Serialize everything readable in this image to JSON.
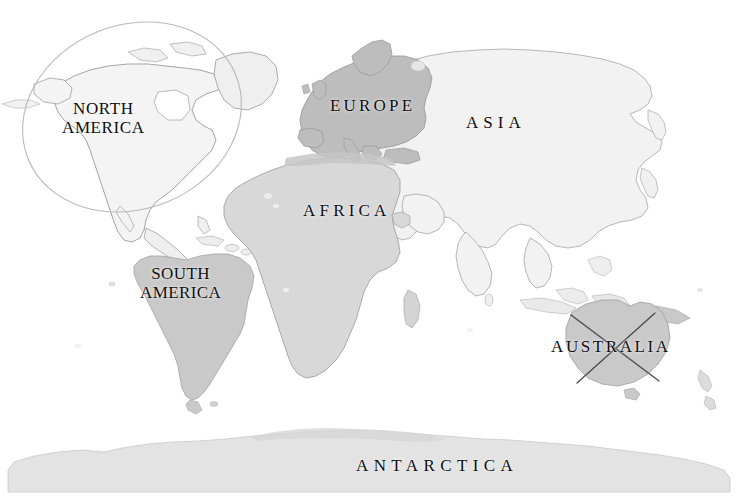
{
  "map": {
    "title": "World Map",
    "projection": "equirectangular",
    "background_color": "#ffffff",
    "width": 737,
    "height": 501,
    "labels": {
      "north_america": "NORTH\nAMERICA",
      "north_america_line1": "NORTH",
      "north_america_line2": "AMERICA",
      "south_america_line1": "SOUTH",
      "south_america_line2": "AMERICA",
      "europe": "EUROPE",
      "africa": "AFRICA",
      "asia": "ASIA",
      "australia": "AUSTRALIA",
      "antarctica": "ANTARCTICA"
    },
    "continents": [
      {
        "name": "north-america",
        "label": "NORTH AMERICA",
        "fill": "#f4f4f4",
        "stroke": "#9a9a9a"
      },
      {
        "name": "south-america",
        "label": "SOUTH AMERICA",
        "fill": "#c9c9c9",
        "stroke": "#a8a8a8"
      },
      {
        "name": "europe",
        "label": "EUROPE",
        "fill": "#bdbdbd",
        "stroke": "#9a9a9a"
      },
      {
        "name": "africa",
        "label": "AFRICA",
        "fill": "#d8d8d8",
        "stroke": "#a0a0a0"
      },
      {
        "name": "asia",
        "label": "ASIA",
        "fill": "#f2f2f2",
        "stroke": "#a5a5a5"
      },
      {
        "name": "australia",
        "label": "AUSTRALIA",
        "fill": "#c9c9c9",
        "stroke": "#a4a4a4"
      },
      {
        "name": "antarctica",
        "label": "ANTARCTICA",
        "fill": "#e3e3e3",
        "stroke": "#c4c4c4"
      }
    ],
    "annotations": [
      {
        "name": "north-america-circle",
        "type": "ellipse",
        "target": "NORTH AMERICA",
        "meaning": "circled / selected",
        "stroke": "#b9b9b9",
        "stroke_width": 1.1,
        "cx": 132,
        "cy": 117,
        "rx": 112,
        "ry": 92,
        "rotation": -22
      },
      {
        "name": "australia-cross-out",
        "type": "cross",
        "target": "AUSTRALIA",
        "meaning": "crossed out / excluded",
        "stroke": "#4a4a4a",
        "stroke_width": 1.3,
        "stroke_1": {
          "x1": 571,
          "y1": 315,
          "x2": 659,
          "y2": 381
        },
        "stroke_2": {
          "x1": 655,
          "y1": 313,
          "x2": 577,
          "y2": 383
        }
      }
    ],
    "colors": {
      "ocean": "#ffffff",
      "land_light": "#f2f2f2",
      "land_mid": "#c9c9c9",
      "land_dark": "#bdbdbd",
      "label_text": "#0d0d0d",
      "outline": "#a3a3a3",
      "annotation_circle": "#b9b9b9",
      "annotation_cross": "#4a4a4a"
    }
  }
}
